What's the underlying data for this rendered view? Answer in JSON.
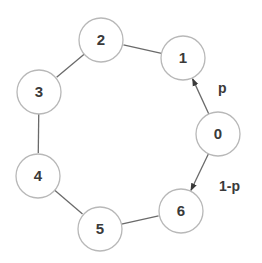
{
  "diagram": {
    "type": "ring-graph",
    "node_radius": 22,
    "colors": {
      "node_stroke": "#b8b8b8",
      "edge": "#6a6a6a",
      "text": "#3a3a3a"
    },
    "nodes": [
      {
        "id": "0",
        "label": "0",
        "x": 218,
        "y": 134
      },
      {
        "id": "1",
        "label": "1",
        "x": 183,
        "y": 58
      },
      {
        "id": "2",
        "label": "2",
        "x": 101,
        "y": 40
      },
      {
        "id": "3",
        "label": "3",
        "x": 39,
        "y": 92
      },
      {
        "id": "4",
        "label": "4",
        "x": 38,
        "y": 176
      },
      {
        "id": "5",
        "label": "5",
        "x": 100,
        "y": 229
      },
      {
        "id": "6",
        "label": "6",
        "x": 181,
        "y": 211
      }
    ],
    "edges": [
      {
        "from": "0",
        "to": "1",
        "directed": true,
        "label": "p",
        "label_x": 218,
        "label_y": 93
      },
      {
        "from": "0",
        "to": "6",
        "directed": true,
        "label": "1-p",
        "label_x": 219,
        "label_y": 191
      },
      {
        "from": "1",
        "to": "2",
        "directed": false
      },
      {
        "from": "2",
        "to": "3",
        "directed": false
      },
      {
        "from": "3",
        "to": "4",
        "directed": false
      },
      {
        "from": "4",
        "to": "5",
        "directed": false
      },
      {
        "from": "5",
        "to": "6",
        "directed": false
      }
    ]
  }
}
